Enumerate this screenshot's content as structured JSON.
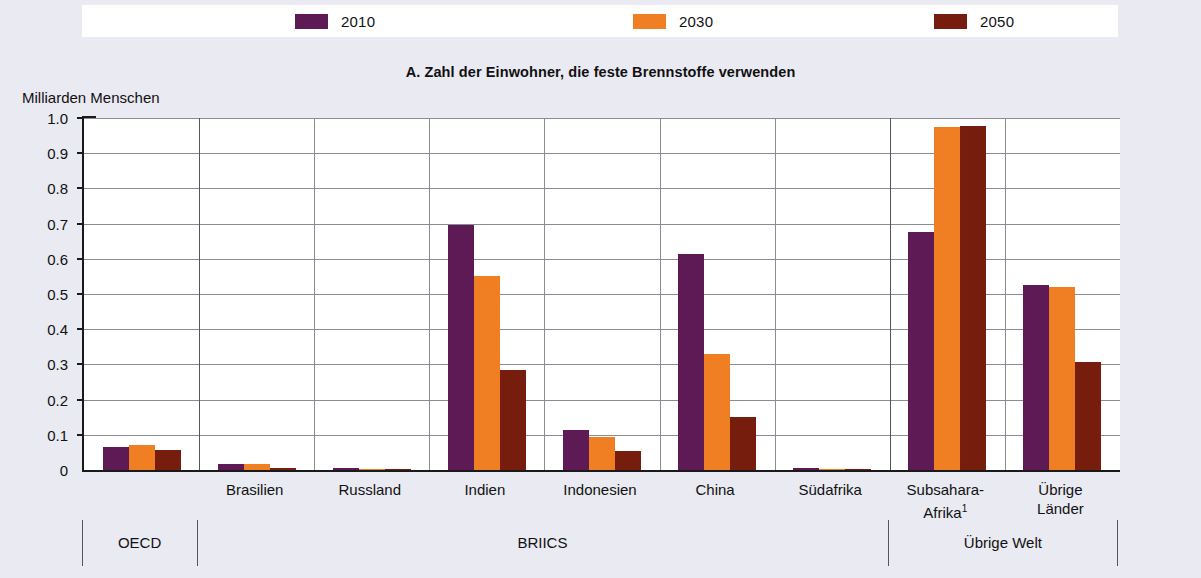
{
  "legend": {
    "items": [
      {
        "label": "2010",
        "color": "#5E1A54",
        "name": "legend-2010"
      },
      {
        "label": "2030",
        "color": "#F07E22",
        "name": "legend-2030"
      },
      {
        "label": "2050",
        "color": "#761D0E",
        "name": "legend-2050"
      }
    ]
  },
  "panel": {
    "title": "A. Zahl der Einwohner, die feste Brennstoffe verwenden",
    "y_unit": "Milliarden Menschen"
  },
  "groups": [
    {
      "label": "OECD",
      "categories": [
        "OECD"
      ]
    },
    {
      "label": "BRIICS",
      "categories": [
        "Brasilien",
        "Russland",
        "Indien",
        "Indonesien",
        "China",
        "Südafrika"
      ]
    },
    {
      "label": "Übrige Welt",
      "categories": [
        "Subsahara-Afrika¹",
        "Übrige Länder"
      ]
    }
  ],
  "footnote_marker": "1",
  "chart_data": {
    "type": "bar",
    "title": "A. Zahl der Einwohner, die feste Brennstoffe verwenden",
    "xlabel": "",
    "ylabel": "Milliarden Menschen",
    "ylim": [
      0,
      1.0
    ],
    "ytick_labels": [
      "1.0",
      "0.9",
      "0.8",
      "0.7",
      "0.6",
      "0.5",
      "0.4",
      "0.3",
      "0.2",
      "0.1",
      "0"
    ],
    "yticks": [
      1.0,
      0.9,
      0.8,
      0.7,
      0.6,
      0.5,
      0.4,
      0.3,
      0.2,
      0.1,
      0
    ],
    "grid": true,
    "legend_position": "top",
    "categories": [
      "OECD",
      "Brasilien",
      "Russland",
      "Indien",
      "Indonesien",
      "China",
      "Südafrika",
      "Subsahara-Afrika¹",
      "Übrige Länder"
    ],
    "series": [
      {
        "name": "2010",
        "color": "#5E1A54",
        "values": [
          0.065,
          0.018,
          0.005,
          0.695,
          0.115,
          0.615,
          0.006,
          0.675,
          0.525
        ]
      },
      {
        "name": "2030",
        "color": "#F07E22",
        "values": [
          0.07,
          0.017,
          0.002,
          0.55,
          0.095,
          0.33,
          0.003,
          0.975,
          0.52
        ]
      },
      {
        "name": "2050",
        "color": "#761D0E",
        "values": [
          0.056,
          0.006,
          0.001,
          0.285,
          0.055,
          0.152,
          0.002,
          0.977,
          0.308
        ]
      }
    ]
  }
}
